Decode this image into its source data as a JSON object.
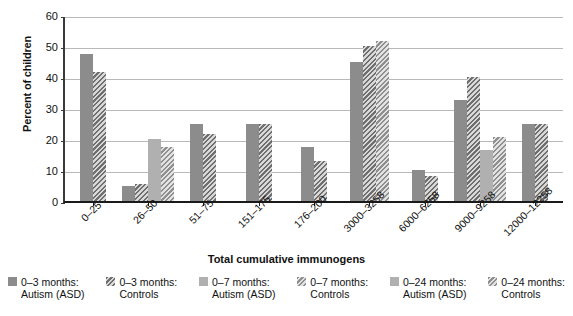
{
  "chart_data": {
    "type": "bar",
    "title": "",
    "xlabel": "Total cumulative immunogens",
    "ylabel": "Percent of children",
    "ylim": [
      0,
      60
    ],
    "yticks": [
      0,
      10,
      20,
      30,
      40,
      50,
      60
    ],
    "ytick_labels": [
      "0",
      "10",
      "20",
      "30",
      "40",
      "50",
      "60"
    ],
    "grid": true,
    "legend_position": "bottom",
    "categories": [
      "0–25",
      "26–50",
      "51–75",
      "151–175",
      "176–200",
      "3000–3258",
      "6000–6258",
      "9000–9258",
      "12000–12258"
    ],
    "series": [
      {
        "name": "0–3 months: Autism (ASD)",
        "fill": "solid",
        "color": "#8c8c8c",
        "values": [
          47.5,
          5.0,
          null,
          null,
          null,
          45.0,
          null,
          null,
          null
        ]
      },
      {
        "name": "0–3 months: Controls",
        "fill": "hatched",
        "color": "#6f6f6f",
        "values": [
          41.5,
          5.5,
          null,
          null,
          null,
          50.0,
          null,
          null,
          null
        ]
      },
      {
        "name": "0–7 months: Autism (ASD)",
        "fill": "solid",
        "color": "#b0b0b0",
        "values": [
          null,
          20.0,
          25.0,
          25.0,
          17.5,
          null,
          10.0,
          32.5,
          null
        ]
      },
      {
        "name": "0–7 months: Controls",
        "fill": "hatched",
        "color": "#8f8f8f",
        "values": [
          null,
          17.5,
          21.5,
          25.0,
          13.0,
          51.5,
          8.0,
          40.0,
          25.0
        ]
      },
      {
        "name": "0–24 months: Autism (ASD)",
        "fill": "solid",
        "color": "#b0b0b0",
        "values": [
          null,
          null,
          null,
          null,
          null,
          null,
          null,
          16.5,
          null
        ]
      },
      {
        "name": "0–24 months: Controls",
        "fill": "hatched",
        "color": "#8f8f8f",
        "values": [
          null,
          null,
          null,
          null,
          null,
          null,
          null,
          20.5,
          25.0
        ]
      }
    ],
    "bars": [
      {
        "group": "0–25",
        "series": "0–3 months: Autism (ASD)",
        "value": 47.5,
        "style": "f-dark"
      },
      {
        "group": "0–25",
        "series": "0–3 months: Controls",
        "value": 41.5,
        "style": "f-dark-h"
      },
      {
        "group": "26–50",
        "series": "0–3 months: Autism (ASD)",
        "value": 5.0,
        "style": "f-dark"
      },
      {
        "group": "26–50",
        "series": "0–3 months: Controls",
        "value": 5.5,
        "style": "f-dark-h"
      },
      {
        "group": "26–50",
        "series": "0–7 months: Autism (ASD)",
        "value": 20.0,
        "style": "f-light"
      },
      {
        "group": "26–50",
        "series": "0–7 months: Controls",
        "value": 17.5,
        "style": "f-light-h"
      },
      {
        "group": "51–75",
        "series": "0–7 months: Autism (ASD)",
        "value": 25.0,
        "style": "f-dark"
      },
      {
        "group": "51–75",
        "series": "0–7 months: Controls",
        "value": 21.5,
        "style": "f-dark-h"
      },
      {
        "group": "151–175",
        "series": "0–7 months: Autism (ASD)",
        "value": 25.0,
        "style": "f-dark"
      },
      {
        "group": "151–175",
        "series": "0–7 months: Controls",
        "value": 25.0,
        "style": "f-dark-h"
      },
      {
        "group": "176–200",
        "series": "0–7 months: Autism (ASD)",
        "value": 17.5,
        "style": "f-dark"
      },
      {
        "group": "176–200",
        "series": "0–7 months: Controls",
        "value": 13.0,
        "style": "f-dark-h"
      },
      {
        "group": "3000–3258",
        "series": "0–3 months: Autism (ASD)",
        "value": 45.0,
        "style": "f-dark"
      },
      {
        "group": "3000–3258",
        "series": "0–3 months: Controls",
        "value": 50.0,
        "style": "f-dark-h"
      },
      {
        "group": "3000–3258",
        "series": "0–7 months: Controls",
        "value": 51.5,
        "style": "f-light-h"
      },
      {
        "group": "6000–6258",
        "series": "0–7 months: Autism (ASD)",
        "value": 10.0,
        "style": "f-dark"
      },
      {
        "group": "6000–6258",
        "series": "0–7 months: Controls",
        "value": 8.0,
        "style": "f-dark-h"
      },
      {
        "group": "9000–9258",
        "series": "0–7 months: Autism (ASD)",
        "value": 32.5,
        "style": "f-dark"
      },
      {
        "group": "9000–9258",
        "series": "0–7 months: Controls",
        "value": 40.0,
        "style": "f-dark-h"
      },
      {
        "group": "9000–9258",
        "series": "0–24 months: Autism (ASD)",
        "value": 16.5,
        "style": "f-light"
      },
      {
        "group": "9000–9258",
        "series": "0–24 months: Controls",
        "value": 20.5,
        "style": "f-light-h"
      },
      {
        "group": "12000–12258",
        "series": "0–7 months: Autism (ASD)",
        "value": 25.0,
        "style": "f-dark"
      },
      {
        "group": "12000–12258",
        "series": "0–7 months: Controls",
        "value": 25.0,
        "style": "f-dark-h"
      }
    ],
    "legend": [
      {
        "label_line1": "0–3 months:",
        "label_line2": "Autism (ASD)",
        "style": "f-dark"
      },
      {
        "label_line1": "0–3 months:",
        "label_line2": "Controls",
        "style": "f-dark-h"
      },
      {
        "label_line1": "0–7 months:",
        "label_line2": "Autism (ASD)",
        "style": "f-light"
      },
      {
        "label_line1": "0–7 months:",
        "label_line2": "Controls",
        "style": "f-light-h"
      },
      {
        "label_line1": "0–24 months:",
        "label_line2": "Autism (ASD)",
        "style": "f-light"
      },
      {
        "label_line1": "0–24 months:",
        "label_line2": "Controls",
        "style": "f-light-h"
      }
    ]
  }
}
